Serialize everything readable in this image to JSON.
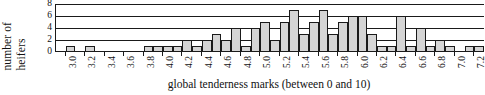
{
  "chart_data": {
    "type": "bar",
    "title": "",
    "subtitle": "",
    "xlabel": "global tenderness marks (between 0 and 10)",
    "ylabel": "number of heifers",
    "ylabel_lines": [
      "number of",
      "heifers"
    ],
    "grid": true,
    "legend": null,
    "xlim": [
      2.9,
      7.3
    ],
    "ylim": [
      0,
      8
    ],
    "yticks": [
      8,
      6,
      4,
      2,
      0
    ],
    "ytick_labels": [
      "8",
      "6",
      "4",
      "2",
      "0"
    ],
    "xticks": [
      3.0,
      3.2,
      3.4,
      3.6,
      3.8,
      4.0,
      4.2,
      4.4,
      4.6,
      4.8,
      5.0,
      5.2,
      5.4,
      5.6,
      5.8,
      6.0,
      6.2,
      6.4,
      6.6,
      6.8,
      7.0,
      7.2
    ],
    "xtick_labels": [
      "3.0",
      "3.2",
      "3.4",
      "3.6",
      "3.8",
      "4.0",
      "4.2",
      "4.4",
      "4.6",
      "4.8",
      "5.0",
      "5.2",
      "5.4",
      "5.6",
      "5.8",
      "6.0",
      "6.2",
      "6.4",
      "6.6",
      "6.8",
      "7.0",
      "7.2"
    ],
    "bin_width": 0.1,
    "bar_color": "#d5d5d5",
    "bar_edge_color": "#1a1a1a",
    "categories": [
      "3.0",
      "3.1",
      "3.2",
      "3.3",
      "3.4",
      "3.5",
      "3.6",
      "3.7",
      "3.8",
      "3.9",
      "4.0",
      "4.1",
      "4.2",
      "4.3",
      "4.4",
      "4.5",
      "4.6",
      "4.7",
      "4.8",
      "4.9",
      "5.0",
      "5.1",
      "5.2",
      "5.3",
      "5.4",
      "5.5",
      "5.6",
      "5.7",
      "5.8",
      "5.9",
      "6.0",
      "6.1",
      "6.2",
      "6.3",
      "6.4",
      "6.5",
      "6.6",
      "6.7",
      "6.8",
      "6.9",
      "7.0",
      "7.1",
      "7.2"
    ],
    "values": [
      1,
      0,
      1,
      0,
      0,
      0,
      0,
      0,
      1,
      1,
      1,
      1,
      2,
      1,
      2,
      3,
      2,
      4,
      1,
      4,
      5,
      2,
      5,
      7,
      3,
      5,
      7,
      3,
      5,
      6,
      6,
      3,
      1,
      1,
      6,
      1,
      4,
      1,
      2,
      1,
      0,
      1,
      1
    ]
  }
}
